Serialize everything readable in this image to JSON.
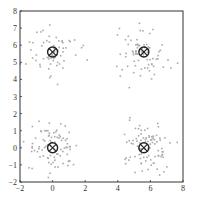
{
  "chart_data": {
    "type": "scatter",
    "title": "",
    "xlabel": "",
    "ylabel": "",
    "xlim": [
      -2,
      8
    ],
    "ylim": [
      -2,
      8
    ],
    "xticks": [
      -2,
      0,
      2,
      4,
      6,
      8
    ],
    "yticks": [
      -2,
      -1,
      0,
      1,
      2,
      3,
      4,
      5,
      6,
      7,
      8
    ],
    "grid": false,
    "legend": null,
    "series": [
      {
        "name": "samples",
        "marker": "dot",
        "color": "#aaaaaa",
        "clusters": [
          {
            "center": [
              0,
              5.6
            ],
            "spread": 0.75,
            "count": 70
          },
          {
            "center": [
              5.6,
              5.6
            ],
            "spread": 0.75,
            "count": 80
          },
          {
            "center": [
              0,
              0
            ],
            "spread": 0.75,
            "count": 90
          },
          {
            "center": [
              5.6,
              0
            ],
            "spread": 0.75,
            "count": 90
          }
        ]
      },
      {
        "name": "centroids",
        "marker": "circle-x",
        "color": "#222222",
        "points": [
          [
            0,
            5.6
          ],
          [
            5.6,
            5.6
          ],
          [
            0,
            0
          ],
          [
            5.6,
            0
          ]
        ]
      }
    ]
  }
}
